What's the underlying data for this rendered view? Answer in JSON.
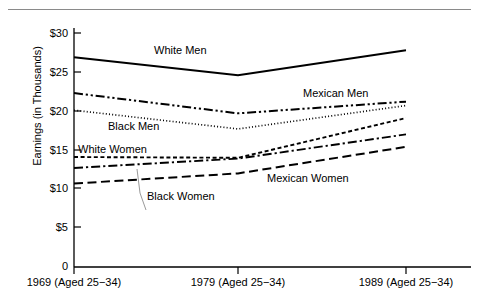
{
  "chart_data": {
    "type": "line",
    "title": "",
    "xlabel": "",
    "ylabel": "Earnings (in Thousands)",
    "categories": [
      "1969 (Aged 25−34)",
      "1979 (Aged 25−34)",
      "1989 (Aged 25−34)"
    ],
    "x": [
      1969,
      1979,
      1989
    ],
    "ylim": [
      0,
      30
    ],
    "yticks": [
      "0",
      "$5",
      "$10",
      "$15",
      "$20",
      "$25",
      "$30"
    ],
    "ytick_values": [
      0,
      5,
      10,
      15,
      20,
      25,
      30
    ],
    "grid": false,
    "legend_position": "inline-annotations",
    "units": "thousands of dollars",
    "series": [
      {
        "name": "White Men",
        "values": [
          26.9,
          24.6,
          27.8
        ],
        "style": "solid",
        "color": "#000000"
      },
      {
        "name": "Mexican Men",
        "values": [
          22.3,
          19.7,
          21.2
        ],
        "style": "dash-dot-dot",
        "color": "#000000"
      },
      {
        "name": "Black Men",
        "values": [
          20.1,
          17.7,
          20.7
        ],
        "style": "dotted",
        "color": "#000000"
      },
      {
        "name": "White Women",
        "values": [
          14.1,
          14.0,
          19.1
        ],
        "style": "short-dash",
        "color": "#000000"
      },
      {
        "name": "Black Women",
        "values": [
          12.7,
          13.9,
          17.0
        ],
        "style": "dash-dot",
        "color": "#000000"
      },
      {
        "name": "Mexican Women",
        "values": [
          10.7,
          12.0,
          15.4
        ],
        "style": "long-dash",
        "color": "#000000"
      }
    ],
    "annotations": [
      {
        "text": "White Men",
        "series": "White Men"
      },
      {
        "text": "Mexican Men",
        "series": "Mexican Men"
      },
      {
        "text": "Black Men",
        "series": "Black Men"
      },
      {
        "text": "White Women",
        "series": "White Women"
      },
      {
        "text": "Black Women",
        "series": "Black Women",
        "leader_line": true
      },
      {
        "text": "Mexican Women",
        "series": "Mexican Women"
      }
    ]
  },
  "axis": {
    "y_title": "Earnings (in Thousands)",
    "y_ticks": [
      "$30",
      "$25",
      "$20",
      "$15",
      "$10",
      "$5",
      "0"
    ],
    "x_ticks": [
      "1969 (Aged 25−34)",
      "1979 (Aged 25−34)",
      "1989 (Aged 25−34)"
    ]
  },
  "labels": {
    "white_men": "White Men",
    "mexican_men": "Mexican Men",
    "black_men": "Black Men",
    "white_women": "White Women",
    "black_women": "Black Women",
    "mexican_women": "Mexican Women"
  },
  "colors": {
    "line": "#000000",
    "axis": "#000000",
    "rule": "#8a8a8a",
    "background": "#ffffff",
    "leader": "#9a9a9a"
  }
}
